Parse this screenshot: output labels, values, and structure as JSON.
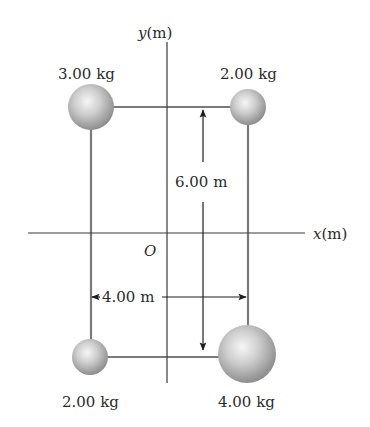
{
  "axes": {
    "x_label_var": "x",
    "x_label_unit": "(m)",
    "y_label_var": "y",
    "y_label_unit": "(m)",
    "origin_label": "O"
  },
  "masses": [
    {
      "label": "3.00 kg",
      "position": "top-left"
    },
    {
      "label": "2.00 kg",
      "position": "top-right"
    },
    {
      "label": "2.00 kg",
      "position": "bottom-left"
    },
    {
      "label": "4.00 kg",
      "position": "bottom-right"
    }
  ],
  "dimensions": {
    "height_label": "6.00 m",
    "width_label": "4.00 m"
  },
  "colors": {
    "line": "#7a7a7a",
    "axis": "#3a3a3a",
    "text": "#2b2b2b",
    "sphere_light": "#f4f4f4",
    "sphere_dark": "#8c8c8c"
  }
}
